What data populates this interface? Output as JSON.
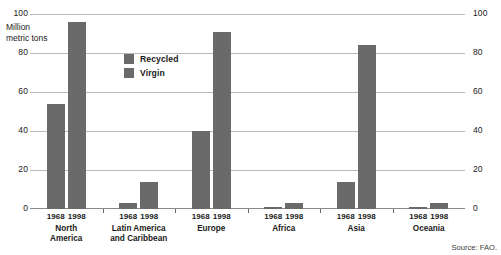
{
  "chart_data": {
    "type": "bar",
    "title": "",
    "subtitle": "",
    "xlabel": "",
    "ylabel": "Million\nmetric tons",
    "ylabel_lines": [
      "Million",
      "metric tons"
    ],
    "ylim": [
      0,
      100
    ],
    "yticks": [
      100,
      80,
      60,
      40,
      20,
      0
    ],
    "ytick_labels": [
      "100",
      "80",
      "60",
      "40",
      "20",
      "0"
    ],
    "right_axis": true,
    "right_ytick_labels": [
      "100",
      "80",
      "60",
      "40",
      "20",
      "0"
    ],
    "grid": true,
    "grid_axis": "y",
    "legend": {
      "position": "inside-upper-center",
      "entries": [
        {
          "label": "Recycled",
          "color": "#6a6a6a"
        },
        {
          "label": "Virgin",
          "color": "#6a6a6a"
        }
      ]
    },
    "categories": [
      "1968",
      "1998"
    ],
    "groups": [
      {
        "name": "North America",
        "name_lines": [
          "North",
          "America"
        ],
        "bars": [
          {
            "year": "1968",
            "value": 54
          },
          {
            "year": "1998",
            "value": 96
          }
        ]
      },
      {
        "name": "Latin America and Caribbean",
        "name_lines": [
          "Latin America",
          "and Caribbean"
        ],
        "bars": [
          {
            "year": "1968",
            "value": 3
          },
          {
            "year": "1998",
            "value": 14
          }
        ]
      },
      {
        "name": "Europe",
        "name_lines": [
          "Europe"
        ],
        "bars": [
          {
            "year": "1968",
            "value": 40
          },
          {
            "year": "1998",
            "value": 91
          }
        ]
      },
      {
        "name": "Africa",
        "name_lines": [
          "Africa"
        ],
        "bars": [
          {
            "year": "1968",
            "value": 1
          },
          {
            "year": "1998",
            "value": 3
          }
        ]
      },
      {
        "name": "Asia",
        "name_lines": [
          "Asia"
        ],
        "bars": [
          {
            "year": "1968",
            "value": 14
          },
          {
            "year": "1998",
            "value": 84
          }
        ]
      },
      {
        "name": "Oceania",
        "name_lines": [
          "Oceania"
        ],
        "bars": [
          {
            "year": "1968",
            "value": 1
          },
          {
            "year": "1998",
            "value": 3
          }
        ]
      }
    ],
    "colors": {
      "bar": "#6a6a6a",
      "grid": "#b9b9b9",
      "axis": "#8a8a8a",
      "text": "#1a1a1a"
    }
  },
  "source": {
    "label": "Source: FAO."
  }
}
